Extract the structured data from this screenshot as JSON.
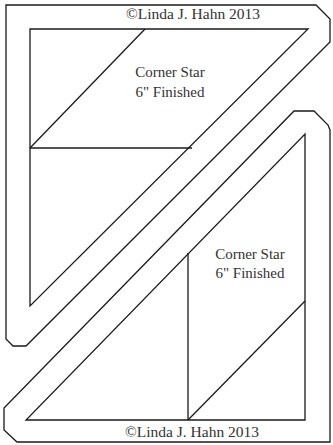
{
  "diagram": {
    "type": "quilt-template",
    "pieces": [
      {
        "id": "top-piece",
        "title": "Corner Star",
        "subtitle": "6\" Finished",
        "copyright": "©Linda J. Hahn 2013"
      },
      {
        "id": "bottom-piece",
        "title": "Corner Star",
        "subtitle": "6\" Finished",
        "copyright": "©Linda J. Hahn 2013"
      }
    ],
    "colors": {
      "line": "#1a1a1a",
      "text": "#333333",
      "background": "#ffffff"
    }
  }
}
